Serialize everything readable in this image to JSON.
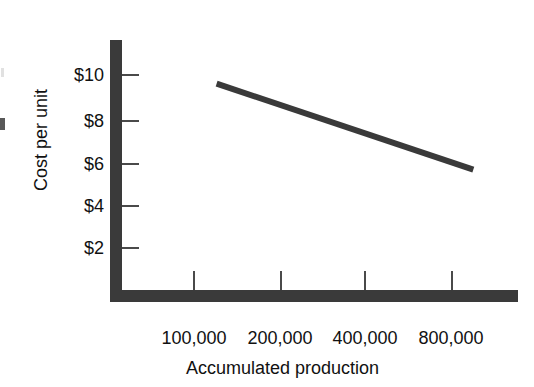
{
  "chart_data": {
    "type": "line",
    "title": "",
    "subtitle": "",
    "xlabel": "Accumulated production",
    "ylabel": "Cost per unit",
    "x_scale": "log",
    "y_scale": "linear",
    "grid": false,
    "legend": false,
    "legend_position": "none",
    "x_tick_labels": [
      "100,000",
      "200,000",
      "400,000",
      "800,000"
    ],
    "x_tick_values": [
      100000,
      200000,
      400000,
      800000
    ],
    "y_tick_labels": [
      "$2",
      "$4",
      "$6",
      "$8",
      "$10"
    ],
    "y_tick_values": [
      2,
      4,
      6,
      8,
      10
    ],
    "ylim": [
      0,
      11.5
    ],
    "xlim": [
      70000,
      1150000
    ],
    "series": [
      {
        "name": "Experience curve",
        "points": [
          {
            "x": 120000,
            "y": 9.6
          },
          {
            "x": 950000,
            "y": 5.6
          }
        ],
        "color": "#3a3a3a",
        "line_width": 6
      }
    ],
    "annotations": []
  },
  "axes": {
    "y": {
      "title": "Cost per unit",
      "ticks": [
        {
          "label": "$10",
          "value": 10
        },
        {
          "label": "$8",
          "value": 8
        },
        {
          "label": "$6",
          "value": 6
        },
        {
          "label": "$4",
          "value": 4
        },
        {
          "label": "$2",
          "value": 2
        }
      ]
    },
    "x": {
      "title": "Accumulated production",
      "ticks": [
        {
          "label": "100,000",
          "value": 100000
        },
        {
          "label": "200,000",
          "value": 200000
        },
        {
          "label": "400,000",
          "value": 400000
        },
        {
          "label": "800,000",
          "value": 800000
        }
      ]
    }
  },
  "colors": {
    "axis": "#3a3a3a",
    "line": "#3a3a3a",
    "tick": "#4a4a4a",
    "text": "#111111",
    "background": "#ffffff"
  }
}
